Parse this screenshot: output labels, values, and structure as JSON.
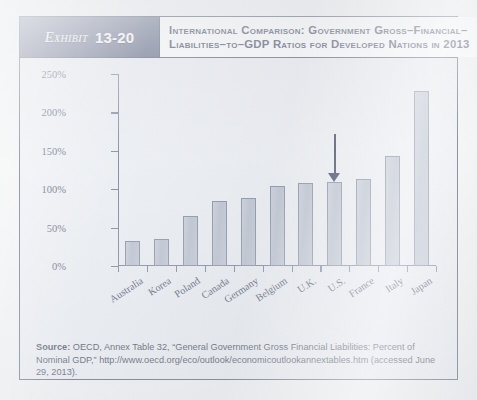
{
  "exhibit": {
    "badge_word": "Exhibit",
    "badge_number": "13-20",
    "title_line1": "International Comparison: Government Gross–Financial–",
    "title_line2": "Liabilities–to–GDP Ratios for Developed Nations in 2013"
  },
  "source": {
    "label": "Source:",
    "text": " OECD, Annex Table 32, “General Government Gross Financial Liabilities: Percent of Nominal GDP,” http://www.oecd.org/eco/outlook/economicoutlookannextables.htm (accessed June 29, 2013)."
  },
  "annotation": {
    "arrow_target": "U.S.",
    "arrow_icon": "down-arrow-icon",
    "arrow_color": "#2b3355"
  },
  "colors": {
    "frame": "#3d4660",
    "badge": "#58617f",
    "title_text": "#27304d",
    "bar_fill": "#b9c0cd",
    "bar_stroke": "#79829a",
    "axis": "#6d7691",
    "panel_bg": "#e9ecf1"
  },
  "chart_data": {
    "type": "bar",
    "xlabel": "",
    "ylabel": "",
    "ylim": [
      0,
      250
    ],
    "yticks": [
      0,
      50,
      100,
      150,
      200,
      250
    ],
    "ytick_labels": [
      "0%",
      "50%",
      "100%",
      "150%",
      "200%",
      "250%"
    ],
    "grid": false,
    "legend": "none",
    "categories": [
      "Australia",
      "Korea",
      "Poland",
      "Canada",
      "Germany",
      "Belgium",
      "U.K.",
      "U.S.",
      "France",
      "Italy",
      "Japan"
    ],
    "values": [
      33,
      35,
      65,
      85,
      88,
      104,
      108,
      109,
      113,
      143,
      228
    ],
    "value_unit": "percent of GDP",
    "annotations": [
      {
        "type": "arrow",
        "points_to": "U.S.",
        "value": 109,
        "direction": "down"
      }
    ]
  }
}
